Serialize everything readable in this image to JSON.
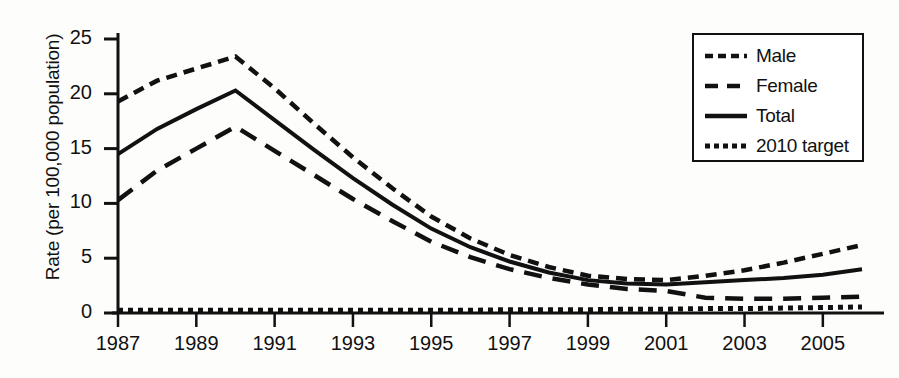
{
  "chart_data": {
    "type": "line",
    "title": "",
    "xlabel": "",
    "ylabel": "Rate (per 100,000 population)",
    "xlim": [
      1987,
      2006
    ],
    "ylim": [
      0,
      25
    ],
    "yticks": [
      0,
      5,
      10,
      15,
      20,
      25
    ],
    "xticks": [
      1987,
      1989,
      1991,
      1993,
      1995,
      1997,
      1999,
      2001,
      2003,
      2005
    ],
    "x": [
      1987,
      1988,
      1989,
      1990,
      1991,
      1992,
      1993,
      1994,
      1995,
      1996,
      1997,
      1998,
      1999,
      2000,
      2001,
      2002,
      2003,
      2004,
      2005,
      2006
    ],
    "grid": false,
    "legend_position": "top-right",
    "series": [
      {
        "name": "Male",
        "style": "dashed",
        "values": [
          19.3,
          21.2,
          22.3,
          23.4,
          20.5,
          17.3,
          14.2,
          11.4,
          8.8,
          6.8,
          5.3,
          4.2,
          3.4,
          3.1,
          3.0,
          3.4,
          3.9,
          4.6,
          5.4,
          6.2
        ]
      },
      {
        "name": "Female",
        "style": "long-dashed",
        "values": [
          10.3,
          13.0,
          15.0,
          17.0,
          14.8,
          12.6,
          10.4,
          8.4,
          6.5,
          5.1,
          4.0,
          3.2,
          2.6,
          2.2,
          2.0,
          1.4,
          1.3,
          1.3,
          1.4,
          1.5
        ]
      },
      {
        "name": "Total",
        "style": "solid",
        "values": [
          14.5,
          16.8,
          18.6,
          20.3,
          17.6,
          14.9,
          12.3,
          9.9,
          7.7,
          6.0,
          4.7,
          3.7,
          3.0,
          2.7,
          2.6,
          2.8,
          3.0,
          3.2,
          3.5,
          4.0
        ]
      },
      {
        "name": "2010 target",
        "style": "dotted",
        "values": [
          0.25,
          0.25,
          0.25,
          0.25,
          0.25,
          0.25,
          0.25,
          0.25,
          0.25,
          0.25,
          0.3,
          0.3,
          0.3,
          0.35,
          0.35,
          0.4,
          0.4,
          0.45,
          0.5,
          0.55
        ]
      }
    ]
  },
  "axes": {
    "y_title": "Rate (per 100,000 population)",
    "y_tick_labels": [
      "25",
      "20",
      "15",
      "10",
      "5",
      "0"
    ],
    "x_tick_labels": [
      "1987",
      "1989",
      "1991",
      "1993",
      "1995",
      "1997",
      "1999",
      "2001",
      "2003",
      "2005"
    ]
  },
  "legend": {
    "entries": [
      {
        "label": "Male",
        "style": "dashed"
      },
      {
        "label": "Female",
        "style": "long-dashed"
      },
      {
        "label": "Total",
        "style": "solid"
      },
      {
        "label": "2010 target",
        "style": "dotted"
      }
    ]
  },
  "colors": {
    "ink": "#111111",
    "background": "#fdfdfc"
  }
}
